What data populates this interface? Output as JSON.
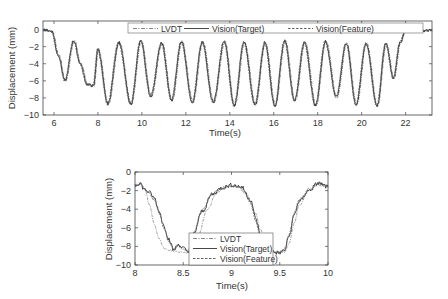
{
  "chart_data": [
    {
      "type": "line",
      "title": "",
      "xlabel": "Time(s)",
      "ylabel": "Displacement (mm)",
      "xlim": [
        5.5,
        23.2
      ],
      "ylim": [
        -10,
        1
      ],
      "xticks": [
        6,
        8,
        10,
        12,
        14,
        16,
        18,
        20,
        22
      ],
      "yticks": [
        0,
        -2,
        -4,
        -6,
        -8,
        -10
      ],
      "grid": false,
      "legend_position": "top-right, horizontal",
      "series": [
        {
          "name": "LVDT",
          "style": "dash-dot"
        },
        {
          "name": "Vision(Target)",
          "style": "solid"
        },
        {
          "name": "Vision(Feature)",
          "style": "dashed"
        }
      ],
      "x": [
        5.5,
        5.9,
        6.2,
        6.5,
        6.9,
        7.2,
        7.5,
        7.8,
        8.0,
        8.45,
        8.95,
        9.5,
        9.95,
        10.4,
        10.9,
        11.35,
        11.8,
        12.3,
        12.75,
        13.25,
        13.75,
        14.2,
        14.65,
        15.15,
        15.6,
        16.05,
        16.5,
        16.95,
        17.4,
        17.9,
        18.35,
        18.85,
        19.3,
        19.75,
        20.2,
        20.7,
        21.1,
        21.45,
        21.75,
        22.0,
        22.5,
        23.2
      ],
      "values": [
        0,
        -0.2,
        -3,
        -6.0,
        -1.3,
        -4,
        -6.4,
        -6.6,
        -2.3,
        -8.7,
        -1.5,
        -8.7,
        -1.3,
        -7.8,
        -1.6,
        -8.3,
        -1.4,
        -8.5,
        -1.5,
        -8.5,
        -1.4,
        -8.9,
        -1.5,
        -8.8,
        -1.5,
        -8.9,
        -1.3,
        -8.3,
        -1.5,
        -8.9,
        -1.4,
        -7.9,
        -1.6,
        -8.8,
        -1.6,
        -8.9,
        -1.6,
        -5.7,
        -1.5,
        -0.1,
        -0.2,
        -0.1
      ]
    },
    {
      "type": "line",
      "title": "",
      "xlabel": "Time(s)",
      "ylabel": "Displacement (mm)",
      "xlim": [
        8,
        10
      ],
      "ylim": [
        -10,
        0
      ],
      "xticks": [
        8,
        8.5,
        9,
        9.5,
        10
      ],
      "yticks": [
        0,
        -2,
        -4,
        -6,
        -8,
        -10
      ],
      "grid": false,
      "legend_position": "lower center (boxed, vertical)",
      "series": [
        {
          "name": "LVDT",
          "style": "dash-dot",
          "x": [
            8.0,
            8.05,
            8.1,
            8.15,
            8.2,
            8.25,
            8.3,
            8.35,
            8.45,
            8.55,
            8.65,
            8.75,
            8.85,
            8.95,
            9.05,
            9.15,
            9.25,
            9.3,
            9.35,
            9.45,
            9.55,
            9.6,
            9.65,
            9.7,
            9.8,
            9.9,
            10.0
          ],
          "values": [
            -1.6,
            -1.3,
            -1.8,
            -3.5,
            -5.6,
            -7.2,
            -8.2,
            -8.4,
            -8.6,
            -8.7,
            -7.0,
            -4.0,
            -2.2,
            -1.6,
            -1.5,
            -2.3,
            -4.5,
            -6.2,
            -7.5,
            -8.6,
            -8.6,
            -7.6,
            -5.5,
            -3.6,
            -2.0,
            -1.3,
            -1.5
          ]
        },
        {
          "name": "Vision(Target)",
          "style": "solid",
          "x": [
            8.0,
            8.05,
            8.1,
            8.15,
            8.2,
            8.25,
            8.3,
            8.35,
            8.4,
            8.45,
            8.5,
            8.55,
            8.6,
            8.7,
            8.8,
            8.9,
            9.0,
            9.1,
            9.2,
            9.25,
            9.3,
            9.35,
            9.4,
            9.5,
            9.55,
            9.6,
            9.65,
            9.7,
            9.8,
            9.9,
            10.0
          ],
          "values": [
            -1.4,
            -1.2,
            -1.9,
            -2.2,
            -2.8,
            -4.2,
            -5.8,
            -7.2,
            -8.4,
            -7.8,
            -8.2,
            -8.6,
            -6.8,
            -4.2,
            -2.4,
            -1.7,
            -1.4,
            -1.6,
            -3.0,
            -5.0,
            -6.8,
            -8.0,
            -8.6,
            -8.7,
            -8.4,
            -6.8,
            -4.6,
            -3.2,
            -2.0,
            -1.2,
            -1.6
          ]
        },
        {
          "name": "Vision(Feature)",
          "style": "dashed",
          "x": [
            8.0,
            8.05,
            8.1,
            8.15,
            8.2,
            8.25,
            8.3,
            8.35,
            8.4,
            8.45,
            8.5,
            8.55,
            8.6,
            8.7,
            8.8,
            8.9,
            9.0,
            9.1,
            9.2,
            9.25,
            9.3,
            9.35,
            9.4,
            9.5,
            9.55,
            9.6,
            9.65,
            9.7,
            9.8,
            9.9,
            10.0
          ],
          "values": [
            -1.5,
            -1.2,
            -1.9,
            -2.3,
            -3.0,
            -4.4,
            -6.0,
            -7.4,
            -8.3,
            -7.9,
            -8.3,
            -8.5,
            -6.6,
            -4.0,
            -2.3,
            -1.7,
            -1.5,
            -1.7,
            -3.2,
            -5.2,
            -7.0,
            -8.1,
            -8.6,
            -8.6,
            -8.3,
            -6.6,
            -4.4,
            -3.0,
            -1.9,
            -1.3,
            -1.6
          ]
        }
      ]
    }
  ],
  "top_chart": {
    "xlabel": "Time(s)",
    "ylabel": "Displacement (mm)",
    "xticks": [
      "6",
      "8",
      "10",
      "12",
      "14",
      "16",
      "18",
      "20",
      "22"
    ],
    "yticks": [
      "0",
      "-2",
      "-4",
      "-6",
      "-8",
      "-10"
    ],
    "legend": [
      "LVDT",
      "Vision(Target)",
      "Vision(Feature)"
    ]
  },
  "bottom_chart": {
    "xlabel": "Time(s)",
    "ylabel": "Displacement (mm)",
    "xticks": [
      "8",
      "8.5",
      "9",
      "9.5",
      "10"
    ],
    "yticks": [
      "0",
      "-2",
      "-4",
      "-6",
      "-8",
      "-10"
    ],
    "legend": [
      "LVDT",
      "Vision(Target)",
      "Vision(Feature)"
    ]
  },
  "colors": {
    "axis": "#444444",
    "line_dark": "#3a3a3a",
    "line_light": "#8a8a8a",
    "background": "#ffffff"
  }
}
